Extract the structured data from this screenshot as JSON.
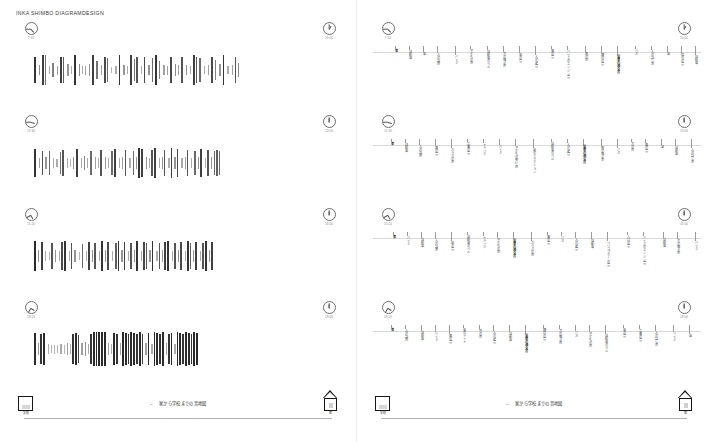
{
  "document": {
    "title": "INKA SHIMBO  DIAGRAMDESIGN",
    "caption": "家から学校までの音地図",
    "caption_arrow": "←"
  },
  "footer": {
    "school_icon": "school-building-icon",
    "school_label": "学校",
    "home_icon": "house-icon",
    "home_label": "家"
  },
  "pages": [
    {
      "id": "page-left",
      "kind": "sound-amplitude-barcode",
      "rows": [
        {
          "clock_start": {
            "label": "7:30",
            "hour_deg": 45,
            "min_deg": 180,
            "icon": "clock-icon"
          },
          "clock_end": {
            "label": "10:00",
            "hour_deg": -60,
            "min_deg": -90,
            "icon": "clock-icon"
          }
        },
        {
          "clock_start": {
            "label": "12:30",
            "hour_deg": 15,
            "min_deg": 180,
            "icon": "clock-icon"
          },
          "clock_end": {
            "label": "13:00",
            "hour_deg": -90,
            "min_deg": -90,
            "icon": "clock-icon"
          }
        },
        {
          "clock_start": {
            "label": "15:20",
            "hour_deg": 60,
            "min_deg": 150,
            "icon": "clock-icon"
          },
          "clock_end": {
            "label": "16:00",
            "hour_deg": -90,
            "min_deg": -90,
            "icon": "clock-icon"
          }
        },
        {
          "clock_start": {
            "label": "18:20",
            "hour_deg": 30,
            "min_deg": 120,
            "icon": "clock-icon"
          },
          "clock_end": {
            "label": "19:00",
            "hour_deg": -90,
            "min_deg": -90,
            "icon": "clock-icon"
          }
        }
      ]
    },
    {
      "id": "page-right",
      "kind": "sound-source-annotations",
      "rows": [
        {
          "clock_start": {
            "label": "7:30",
            "hour_deg": 45,
            "min_deg": 180,
            "icon": "clock-icon"
          },
          "clock_end": {
            "label": "10:00",
            "hour_deg": -60,
            "min_deg": -90,
            "icon": "clock-icon"
          }
        },
        {
          "clock_start": {
            "label": "12:30",
            "hour_deg": 15,
            "min_deg": 180,
            "icon": "clock-icon"
          },
          "clock_end": {
            "label": "13:00",
            "hour_deg": -90,
            "min_deg": -90,
            "icon": "clock-icon"
          }
        },
        {
          "clock_start": {
            "label": "15:20",
            "hour_deg": 60,
            "min_deg": 150,
            "icon": "clock-icon"
          },
          "clock_end": {
            "label": "16:00",
            "hour_deg": -90,
            "min_deg": -90,
            "icon": "clock-icon"
          }
        },
        {
          "clock_start": {
            "label": "18:20",
            "hour_deg": 30,
            "min_deg": 120,
            "icon": "clock-icon"
          },
          "clock_end": {
            "label": "19:00",
            "hour_deg": -90,
            "min_deg": -90,
            "icon": "clock-icon"
          }
        }
      ]
    }
  ],
  "chart_data": {
    "type": "bar",
    "title": "家から学校までの音地図",
    "xlabel": "",
    "ylabel": "",
    "ylim": [
      0,
      36
    ],
    "note": "Four time-band rows; each row is a barcode of sound events. value = bar height (px of 36), shade = darkness 0-1, gap = px before bar.",
    "series": [
      {
        "name": "7:30–10:00",
        "values": [
          26,
          10,
          30,
          30,
          8,
          14,
          9,
          26,
          26,
          12,
          8,
          30,
          12,
          8,
          9,
          12,
          30,
          18,
          10,
          26,
          24,
          6,
          8,
          30,
          10,
          8,
          30,
          22,
          26,
          8,
          26,
          10,
          24,
          30,
          18,
          10,
          9,
          26,
          12,
          10,
          26,
          10,
          8,
          30,
          26,
          24,
          8,
          10,
          26,
          20,
          12,
          30,
          8,
          10,
          26,
          14
        ],
        "shades": [
          0.85,
          0.45,
          0.8,
          0.55,
          0.3,
          0.5,
          0.35,
          0.8,
          0.65,
          0.4,
          0.3,
          0.85,
          0.45,
          0.3,
          0.35,
          0.4,
          0.8,
          0.55,
          0.35,
          0.75,
          0.6,
          0.25,
          0.3,
          0.85,
          0.4,
          0.3,
          0.8,
          0.55,
          0.7,
          0.3,
          0.75,
          0.4,
          0.6,
          0.85,
          0.5,
          0.35,
          0.35,
          0.75,
          0.45,
          0.35,
          0.7,
          0.4,
          0.3,
          0.8,
          0.7,
          0.6,
          0.3,
          0.35,
          0.75,
          0.5,
          0.4,
          0.85,
          0.3,
          0.35,
          0.7,
          0.45
        ],
        "gaps": [
          0,
          3,
          2,
          1,
          3,
          2,
          3,
          2,
          1,
          3,
          2,
          2,
          3,
          2,
          2,
          3,
          2,
          2,
          3,
          2,
          1,
          3,
          3,
          2,
          3,
          2,
          2,
          2,
          1,
          3,
          2,
          3,
          2,
          2,
          2,
          3,
          2,
          2,
          3,
          2,
          2,
          3,
          3,
          2,
          1,
          2,
          3,
          3,
          2,
          2,
          3,
          2,
          3,
          3,
          2,
          2
        ]
      },
      {
        "name": "12:30–13:00",
        "values": [
          28,
          10,
          24,
          12,
          24,
          10,
          8,
          22,
          26,
          10,
          8,
          12,
          28,
          10,
          14,
          10,
          24,
          12,
          10,
          26,
          12,
          10,
          24,
          28,
          10,
          12,
          26,
          10,
          24,
          12,
          30,
          28,
          12,
          10,
          26,
          30,
          10,
          12,
          26,
          10,
          30,
          12,
          28,
          10,
          12,
          26,
          10,
          24,
          12,
          28,
          10,
          26,
          12,
          24,
          26,
          24
        ],
        "shades": [
          0.85,
          0.35,
          0.7,
          0.4,
          0.6,
          0.3,
          0.3,
          0.55,
          0.7,
          0.3,
          0.25,
          0.4,
          0.8,
          0.3,
          0.45,
          0.3,
          0.6,
          0.35,
          0.3,
          0.7,
          0.4,
          0.3,
          0.6,
          0.8,
          0.3,
          0.35,
          0.7,
          0.3,
          0.6,
          0.4,
          0.85,
          0.8,
          0.4,
          0.3,
          0.7,
          0.8,
          0.3,
          0.4,
          0.7,
          0.3,
          0.8,
          0.4,
          0.75,
          0.3,
          0.35,
          0.7,
          0.3,
          0.6,
          0.4,
          0.8,
          0.3,
          0.7,
          0.4,
          0.6,
          0.65,
          0.6
        ],
        "gaps": [
          0,
          3,
          2,
          2,
          2,
          3,
          2,
          2,
          1,
          3,
          2,
          2,
          2,
          3,
          2,
          2,
          2,
          3,
          2,
          1,
          3,
          2,
          2,
          1,
          3,
          2,
          2,
          3,
          2,
          2,
          1,
          1,
          3,
          2,
          1,
          1,
          3,
          2,
          1,
          3,
          1,
          2,
          1,
          3,
          2,
          1,
          3,
          2,
          2,
          1,
          3,
          1,
          2,
          2,
          1,
          1
        ]
      },
      {
        "name": "15:20–16:00",
        "values": [
          30,
          12,
          28,
          10,
          8,
          26,
          12,
          10,
          28,
          30,
          10,
          26,
          12,
          8,
          24,
          10,
          28,
          12,
          26,
          10,
          30,
          12,
          28,
          10,
          26,
          30,
          12,
          28,
          10,
          26,
          12,
          30,
          10,
          28,
          26,
          12,
          30,
          10,
          26,
          12,
          28,
          30,
          10,
          26,
          12,
          28,
          10,
          30,
          26,
          12,
          28,
          10,
          26,
          30,
          12,
          28
        ],
        "shades": [
          0.9,
          0.4,
          0.8,
          0.3,
          0.25,
          0.7,
          0.4,
          0.3,
          0.75,
          0.85,
          0.3,
          0.7,
          0.4,
          0.25,
          0.6,
          0.3,
          0.8,
          0.4,
          0.7,
          0.3,
          0.85,
          0.4,
          0.75,
          0.3,
          0.65,
          0.85,
          0.4,
          0.8,
          0.3,
          0.7,
          0.4,
          0.85,
          0.3,
          0.75,
          0.65,
          0.4,
          0.85,
          0.3,
          0.7,
          0.4,
          0.8,
          0.85,
          0.3,
          0.7,
          0.4,
          0.75,
          0.3,
          0.85,
          0.65,
          0.4,
          0.8,
          0.3,
          0.7,
          0.85,
          0.4,
          0.8
        ],
        "gaps": [
          0,
          2,
          2,
          2,
          3,
          1,
          2,
          3,
          1,
          1,
          3,
          1,
          2,
          3,
          2,
          3,
          1,
          2,
          1,
          3,
          1,
          2,
          1,
          3,
          2,
          1,
          2,
          1,
          3,
          1,
          2,
          1,
          3,
          1,
          1,
          2,
          1,
          3,
          1,
          2,
          1,
          1,
          3,
          1,
          2,
          1,
          3,
          1,
          1,
          2,
          1,
          3,
          1,
          1,
          2,
          1
        ]
      },
      {
        "name": "18:20–19:00",
        "values": [
          32,
          12,
          30,
          32,
          10,
          8,
          9,
          8,
          10,
          9,
          12,
          10,
          30,
          32,
          28,
          12,
          14,
          10,
          30,
          34,
          34,
          34,
          34,
          34,
          12,
          10,
          32,
          30,
          12,
          34,
          32,
          30,
          34,
          32,
          30,
          34,
          30,
          12,
          32,
          10,
          34,
          32,
          30,
          34,
          12,
          30,
          32,
          10,
          34,
          32,
          30,
          34,
          32,
          30,
          34,
          32
        ],
        "shades": [
          0.9,
          0.4,
          0.85,
          0.9,
          0.3,
          0.25,
          0.25,
          0.25,
          0.3,
          0.25,
          0.35,
          0.3,
          0.85,
          0.9,
          0.75,
          0.35,
          0.4,
          0.3,
          0.85,
          0.9,
          0.9,
          0.9,
          0.9,
          0.9,
          0.35,
          0.3,
          0.9,
          0.85,
          0.35,
          0.9,
          0.9,
          0.85,
          0.9,
          0.9,
          0.85,
          0.9,
          0.8,
          0.35,
          0.9,
          0.3,
          0.9,
          0.9,
          0.85,
          0.9,
          0.35,
          0.85,
          0.9,
          0.3,
          0.9,
          0.9,
          0.85,
          0.9,
          0.9,
          0.85,
          0.9,
          0.9
        ],
        "gaps": [
          0,
          2,
          1,
          1,
          3,
          2,
          2,
          2,
          2,
          2,
          2,
          2,
          1,
          1,
          1,
          2,
          2,
          2,
          1,
          1,
          1,
          1,
          1,
          1,
          2,
          2,
          1,
          1,
          2,
          1,
          1,
          1,
          1,
          1,
          1,
          1,
          1,
          2,
          1,
          2,
          1,
          1,
          1,
          1,
          2,
          1,
          1,
          2,
          1,
          1,
          1,
          1,
          1,
          1,
          1,
          1
        ]
      }
    ]
  },
  "annotations": {
    "rows": [
      {
        "name": "7:30–10:00",
        "items": [
          {
            "x": 20,
            "text": "車",
            "dark": true
          },
          {
            "x": 34,
            "text": "自転車"
          },
          {
            "x": 48,
            "text": "車"
          },
          {
            "x": 62,
            "text": "人の話声"
          },
          {
            "x": 80,
            "text": "バイク"
          },
          {
            "x": 95,
            "text": "子どもの声"
          },
          {
            "x": 112,
            "text": "自転車のベル"
          },
          {
            "x": 128,
            "text": "犬の鳴き声"
          },
          {
            "x": 144,
            "text": "車の音"
          },
          {
            "x": 160,
            "text": "人の足音"
          },
          {
            "x": 176,
            "text": "風の音"
          },
          {
            "x": 192,
            "text": "バイクのエンジン音"
          },
          {
            "x": 210,
            "text": "鳥の声"
          },
          {
            "x": 226,
            "text": "踏切の音"
          },
          {
            "x": 242,
            "text": "電車の通る音",
            "dark": true
          },
          {
            "x": 260,
            "text": "バス"
          },
          {
            "x": 276,
            "text": "人の話し声"
          },
          {
            "x": 292,
            "text": "車"
          },
          {
            "x": 306,
            "text": "信号の音"
          },
          {
            "x": 320,
            "text": "自転車"
          }
        ]
      },
      {
        "name": "12:30–13:00",
        "items": [
          {
            "x": 16,
            "text": "車",
            "dark": true
          },
          {
            "x": 30,
            "text": "自転車"
          },
          {
            "x": 44,
            "text": "人の話声"
          },
          {
            "x": 60,
            "text": "風の音"
          },
          {
            "x": 76,
            "text": "カラスの声"
          },
          {
            "x": 92,
            "text": "工事の音"
          },
          {
            "x": 108,
            "text": "トラック"
          },
          {
            "x": 124,
            "text": "バイク"
          },
          {
            "x": 140,
            "text": "子どもの笑い声"
          },
          {
            "x": 158,
            "text": "車のクラクション"
          },
          {
            "x": 176,
            "text": "自転車のベル"
          },
          {
            "x": 192,
            "text": "人の足音"
          },
          {
            "x": 208,
            "text": "電車の通る音",
            "dark": true
          },
          {
            "x": 226,
            "text": "鳥の鳴き声"
          },
          {
            "x": 242,
            "text": "バス"
          },
          {
            "x": 256,
            "text": "犬の声"
          },
          {
            "x": 270,
            "text": "風の音"
          },
          {
            "x": 286,
            "text": "車"
          },
          {
            "x": 300,
            "text": "自転車"
          },
          {
            "x": 316,
            "text": "人の話し声"
          }
        ]
      },
      {
        "name": "15:20–16:00",
        "items": [
          {
            "x": 18,
            "text": "車",
            "dark": true
          },
          {
            "x": 32,
            "text": "バイク"
          },
          {
            "x": 46,
            "text": "自転車"
          },
          {
            "x": 60,
            "text": "人の話声"
          },
          {
            "x": 76,
            "text": "車の音"
          },
          {
            "x": 92,
            "text": "自転車のベル"
          },
          {
            "x": 108,
            "text": "トラック"
          },
          {
            "x": 122,
            "text": "子どもの声"
          },
          {
            "x": 138,
            "text": "電車の通る音",
            "dark": true
          },
          {
            "x": 156,
            "text": "カラスの声"
          },
          {
            "x": 172,
            "text": "風の音"
          },
          {
            "x": 186,
            "text": "バス"
          },
          {
            "x": 200,
            "text": "人の足音"
          },
          {
            "x": 216,
            "text": "自動車"
          },
          {
            "x": 232,
            "text": "ヘリコプターの音"
          },
          {
            "x": 252,
            "text": "入口の音"
          },
          {
            "x": 268,
            "text": "バイクのエンジン音"
          },
          {
            "x": 288,
            "text": "自転車"
          },
          {
            "x": 302,
            "text": "犬の鳴き声"
          },
          {
            "x": 320,
            "text": "バイク"
          }
        ]
      },
      {
        "name": "18:20–19:00",
        "items": [
          {
            "x": 16,
            "text": "車",
            "dark": true
          },
          {
            "x": 30,
            "text": "人の話声"
          },
          {
            "x": 46,
            "text": "自転車"
          },
          {
            "x": 60,
            "text": "バイク"
          },
          {
            "x": 74,
            "text": "風の音"
          },
          {
            "x": 88,
            "text": "車のライト"
          },
          {
            "x": 104,
            "text": "虫の声"
          },
          {
            "x": 118,
            "text": "人の足音"
          },
          {
            "x": 134,
            "text": "自動車"
          },
          {
            "x": 150,
            "text": "電車の通る音",
            "dark": true
          },
          {
            "x": 168,
            "text": "踏切の音"
          },
          {
            "x": 184,
            "text": "犬の鳴き声"
          },
          {
            "x": 200,
            "text": "バス"
          },
          {
            "x": 214,
            "text": "子どもの声"
          },
          {
            "x": 230,
            "text": "自転車のベル"
          },
          {
            "x": 248,
            "text": "車の音"
          },
          {
            "x": 264,
            "text": "工事の音"
          },
          {
            "x": 280,
            "text": "人の話し声"
          },
          {
            "x": 298,
            "text": "バイク"
          },
          {
            "x": 314,
            "text": "車"
          }
        ]
      }
    ]
  }
}
